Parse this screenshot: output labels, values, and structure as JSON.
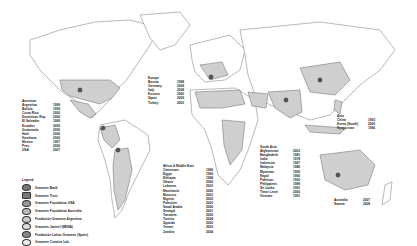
{
  "regions": {
    "americas": {
      "heading": "Americas",
      "items": [
        {
          "country": "Argentina",
          "year": "1999"
        },
        {
          "country": "Bolivia",
          "year": "1999"
        },
        {
          "country": "Costa Rica",
          "year": "2000"
        },
        {
          "country": "Dominican Rep.",
          "year": "2006"
        },
        {
          "country": "El Salvador",
          "year": "1999"
        },
        {
          "country": "Ecuador",
          "year": "2005"
        },
        {
          "country": "Guatemala",
          "year": "2005"
        },
        {
          "country": "Haiti",
          "year": "2006"
        },
        {
          "country": "Honduras",
          "year": "2000"
        },
        {
          "country": "Mexico",
          "year": "1997"
        },
        {
          "country": "Peru",
          "year": "2006"
        },
        {
          "country": "USA",
          "year": "2007"
        }
      ]
    },
    "europe": {
      "heading": "Europe",
      "items": [
        {
          "country": "Bosnia",
          "year": "1998"
        },
        {
          "country": "Germany",
          "year": "2009"
        },
        {
          "country": "Italy",
          "year": "2008"
        },
        {
          "country": "Kosovo",
          "year": "2000"
        },
        {
          "country": "Spain",
          "year": "2009"
        },
        {
          "country": "Turkey",
          "year": "2003"
        }
      ]
    },
    "africa_middle_east": {
      "heading": "Africa & Middle East",
      "items": [
        {
          "country": "Cameroon",
          "year": "1996"
        },
        {
          "country": "Egypt",
          "year": "1999"
        },
        {
          "country": "Ethiopia",
          "year": "1998"
        },
        {
          "country": "Ghana",
          "year": "2000"
        },
        {
          "country": "Lebanon",
          "year": "2003"
        },
        {
          "country": "Mauritania",
          "year": "2000"
        },
        {
          "country": "Morocco",
          "year": "2003"
        },
        {
          "country": "Nigeria",
          "year": "2002"
        },
        {
          "country": "Palestine",
          "year": "2003"
        },
        {
          "country": "Saudi Arabia",
          "year": "2006"
        },
        {
          "country": "Senegal",
          "year": "2001"
        },
        {
          "country": "Tanzania",
          "year": "2000"
        },
        {
          "country": "Tunisia",
          "year": "2004"
        },
        {
          "country": "Uganda",
          "year": "2000"
        },
        {
          "country": "Yemen",
          "year": "2003"
        },
        {
          "country": "Zambia",
          "year": "2004"
        }
      ]
    },
    "south_asia": {
      "heading": "South Asia",
      "items": [
        {
          "country": "Afghanistan",
          "year": "2003"
        },
        {
          "country": "Bangladesh",
          "year": "1983"
        },
        {
          "country": "India",
          "year": "1978"
        },
        {
          "country": "Indonesia",
          "year": "1997"
        },
        {
          "country": "Malaysia",
          "year": "1986"
        },
        {
          "country": "Myanmar",
          "year": "1995"
        },
        {
          "country": "Nepal",
          "year": "1990"
        },
        {
          "country": "Pakistan",
          "year": "1993"
        },
        {
          "country": "Philippines",
          "year": "1989"
        },
        {
          "country": "Sri Lanka",
          "year": "1991"
        },
        {
          "country": "Timor Leste",
          "year": "2000"
        },
        {
          "country": "Vietnam",
          "year": "1991"
        }
      ]
    },
    "east_asia": {
      "heading": "Asia",
      "items": [
        {
          "country": "China",
          "year": "1993"
        },
        {
          "country": "Korea (South)",
          "year": "2009"
        },
        {
          "country": "Kyrgyzstan",
          "year": "1996"
        }
      ]
    },
    "oceania": {
      "items": [
        {
          "country": "Australia",
          "year": "2007"
        },
        {
          "country": "Samoa",
          "year": "2008"
        }
      ]
    }
  },
  "legend": {
    "title": "Legend",
    "items": [
      {
        "label": "Grameen Bank",
        "icon": "bank-icon"
      },
      {
        "label": "Grameen Trust",
        "icon": "trust-icon"
      },
      {
        "label": "Grameen Foundation USA",
        "icon": "foundation-usa-icon"
      },
      {
        "label": "Grameen Foundation Australia",
        "icon": "foundation-australia-icon"
      },
      {
        "label": "Fundación Grameen Argentina",
        "icon": "fundacion-argentina-icon"
      },
      {
        "label": "Grameen Jameel (MENA)",
        "icon": "jameel-icon"
      },
      {
        "label": "Fundación Latino Grameen (Spain)",
        "icon": "latino-icon"
      },
      {
        "label": "Grameen Creative Lab",
        "icon": "creative-lab-icon"
      }
    ]
  },
  "colors": {
    "highlight": "#cfcfcf",
    "land": "#ffffff",
    "border": "#8a8a8a"
  }
}
